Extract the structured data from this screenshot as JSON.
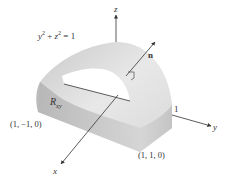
{
  "figure": {
    "equation_label": "y² + z² = 1",
    "equation_parts": {
      "y": "y",
      "y_exp": "2",
      "plus": " + ",
      "z": "z",
      "z_exp": "2",
      "eq": " = 1"
    },
    "axes": {
      "x": {
        "label": "x"
      },
      "y": {
        "label": "y",
        "tick_label": "1"
      },
      "z": {
        "label": "z"
      }
    },
    "normal_vector": {
      "label": "n"
    },
    "region": {
      "label": "R",
      "subscript": "xy"
    },
    "points": [
      {
        "label": "(1, −1, 0)"
      },
      {
        "label": "(1, 1, 0)"
      }
    ],
    "colors": {
      "surface_light": "#e6e6e6",
      "surface_mid": "#cfcfcf",
      "surface_dark": "#b5b5b5",
      "axis": "#333333",
      "hole": "#ffffff"
    }
  }
}
